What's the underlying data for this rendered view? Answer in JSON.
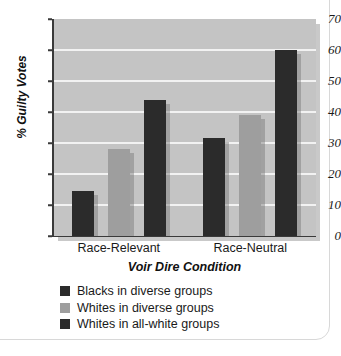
{
  "chart_data": {
    "type": "bar",
    "title": "",
    "subtitle": "",
    "xlabel": "Voir Dire Condition",
    "ylabel": "% Guilty Votes",
    "categories": [
      "Race-Relevant",
      "Race-Neutral"
    ],
    "series": [
      {
        "name": "Blacks in diverse groups",
        "color": "#2b2b2b",
        "values": [
          14.5,
          31.5
        ]
      },
      {
        "name": "Whites in diverse groups",
        "color": "#9e9e9e",
        "values": [
          28.0,
          39.0
        ]
      },
      {
        "name": "Whites in all-white groups",
        "color": "#2b2b2b",
        "values": [
          44.0,
          60.0
        ]
      }
    ],
    "ylim": [
      0,
      70
    ],
    "yticks": [
      0,
      10,
      20,
      30,
      40,
      50,
      60,
      70
    ],
    "ytick_labels": [
      "0",
      "10",
      "20",
      "30",
      "40",
      "50",
      "60",
      "70"
    ],
    "grid": true,
    "grid_color": "#f2f2f2",
    "plot_background": "#c4c4c4",
    "legend_position": "below-left",
    "annotations": []
  },
  "legend": {
    "items": [
      {
        "label": "Blacks in diverse groups",
        "swatch": "#2b2b2b"
      },
      {
        "label": "Whites in diverse groups",
        "swatch": "#9e9e9e"
      },
      {
        "label": "Whites in all-white groups",
        "swatch": "#2b2b2b"
      }
    ]
  }
}
